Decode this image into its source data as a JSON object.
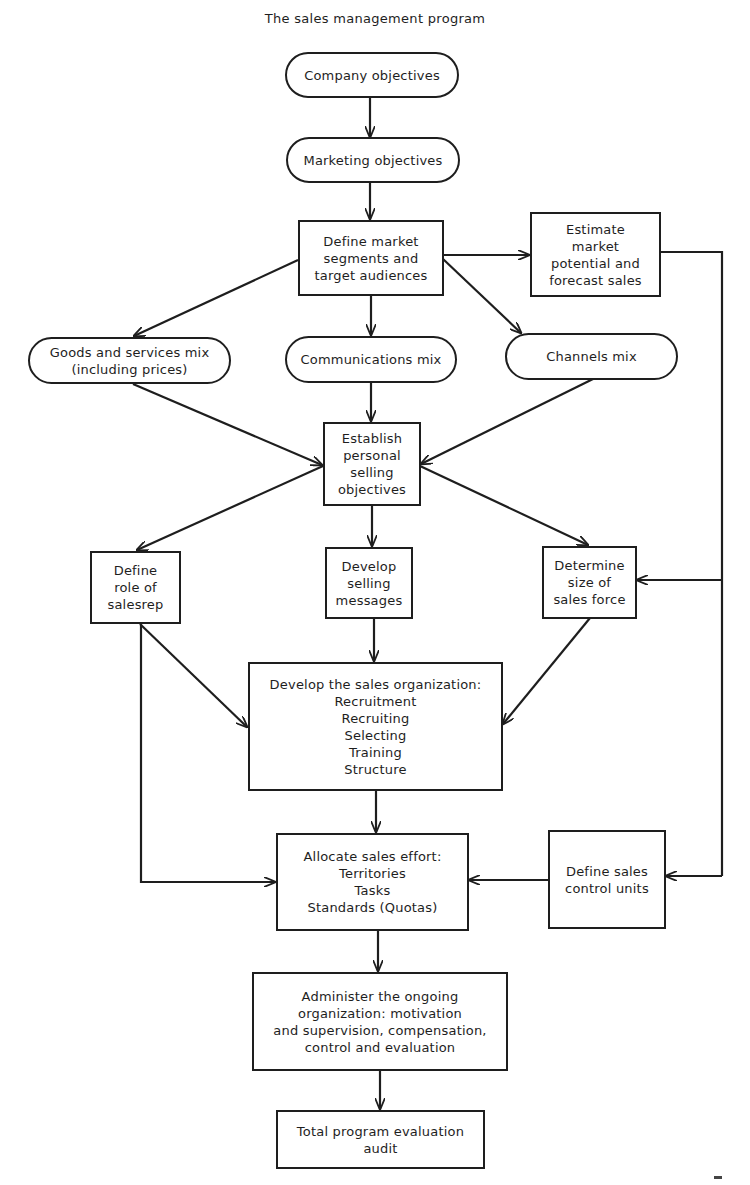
{
  "title": "The sales management program",
  "nodes": {
    "company_objectives": {
      "shape": "pill",
      "lines": [
        "Company objectives"
      ]
    },
    "marketing_objectives": {
      "shape": "pill",
      "lines": [
        "Marketing objectives"
      ]
    },
    "define_market_segments": {
      "shape": "rect",
      "lines": [
        "Define market",
        "segments and",
        "target audiences"
      ]
    },
    "estimate_market_potential": {
      "shape": "rect",
      "lines": [
        "Estimate",
        "market",
        "potential and",
        "forecast sales"
      ]
    },
    "goods_services_mix": {
      "shape": "pill",
      "lines": [
        "Goods and services mix",
        "(including prices)"
      ]
    },
    "communications_mix": {
      "shape": "pill",
      "lines": [
        "Communications mix"
      ]
    },
    "channels_mix": {
      "shape": "pill",
      "lines": [
        "Channels mix"
      ]
    },
    "establish_selling_objectives": {
      "shape": "rect",
      "lines": [
        "Establish",
        "personal",
        "selling",
        "objectives"
      ]
    },
    "define_role_salesrep": {
      "shape": "rect",
      "lines": [
        "Define",
        "role of",
        "salesrep"
      ]
    },
    "develop_selling_messages": {
      "shape": "rect",
      "lines": [
        "Develop",
        "selling",
        "messages"
      ]
    },
    "determine_sales_force_size": {
      "shape": "rect",
      "lines": [
        "Determine",
        "size of",
        "sales force"
      ]
    },
    "develop_sales_organization": {
      "shape": "rect",
      "lines": [
        "Develop the sales organization:",
        "Recruitment",
        "Recruiting",
        "Selecting",
        "Training",
        "Structure"
      ]
    },
    "allocate_sales_effort": {
      "shape": "rect",
      "lines": [
        "Allocate sales effort:",
        "Territories",
        "Tasks",
        "Standards (Quotas)"
      ]
    },
    "define_sales_control_units": {
      "shape": "rect",
      "lines": [
        "Define sales",
        "control units"
      ]
    },
    "administer_organization": {
      "shape": "rect",
      "lines": [
        "Administer the ongoing",
        "organization: motivation",
        "and supervision, compensation,",
        "control and evaluation"
      ]
    },
    "total_program_evaluation": {
      "shape": "rect",
      "lines": [
        "Total program evaluation",
        "audit"
      ]
    }
  },
  "edges": [
    {
      "from": "company_objectives",
      "to": "marketing_objectives"
    },
    {
      "from": "marketing_objectives",
      "to": "define_market_segments"
    },
    {
      "from": "define_market_segments",
      "to": "estimate_market_potential"
    },
    {
      "from": "define_market_segments",
      "to": "goods_services_mix"
    },
    {
      "from": "define_market_segments",
      "to": "communications_mix"
    },
    {
      "from": "define_market_segments",
      "to": "channels_mix"
    },
    {
      "from": "goods_services_mix",
      "to": "establish_selling_objectives"
    },
    {
      "from": "communications_mix",
      "to": "establish_selling_objectives"
    },
    {
      "from": "channels_mix",
      "to": "establish_selling_objectives"
    },
    {
      "from": "establish_selling_objectives",
      "to": "define_role_salesrep"
    },
    {
      "from": "establish_selling_objectives",
      "to": "develop_selling_messages"
    },
    {
      "from": "establish_selling_objectives",
      "to": "determine_sales_force_size"
    },
    {
      "from": "estimate_market_potential",
      "to": "determine_sales_force_size"
    },
    {
      "from": "estimate_market_potential",
      "to": "define_sales_control_units"
    },
    {
      "from": "define_role_salesrep",
      "to": "develop_sales_organization"
    },
    {
      "from": "define_role_salesrep",
      "to": "allocate_sales_effort"
    },
    {
      "from": "develop_selling_messages",
      "to": "develop_sales_organization"
    },
    {
      "from": "determine_sales_force_size",
      "to": "develop_sales_organization"
    },
    {
      "from": "develop_sales_organization",
      "to": "allocate_sales_effort"
    },
    {
      "from": "define_sales_control_units",
      "to": "allocate_sales_effort"
    },
    {
      "from": "allocate_sales_effort",
      "to": "administer_organization"
    },
    {
      "from": "administer_organization",
      "to": "total_program_evaluation"
    }
  ],
  "colors": {
    "ink": "#1e1e1e",
    "background": "#ffffff"
  }
}
